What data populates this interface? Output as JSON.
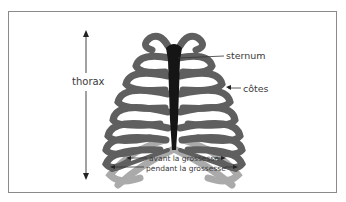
{
  "diagram": {
    "labels": {
      "thorax": "thorax",
      "sternum": "sternum",
      "cotes": "côtes",
      "avant": "avant la grossesse",
      "pendant": "pendant la grossesse"
    },
    "colors": {
      "ribs_before": "#5f5f5f",
      "ribs_during": "#aaaaaa",
      "sternum": "#151515",
      "frame": "#8a8a8a",
      "text": "#3a3a3a"
    }
  }
}
